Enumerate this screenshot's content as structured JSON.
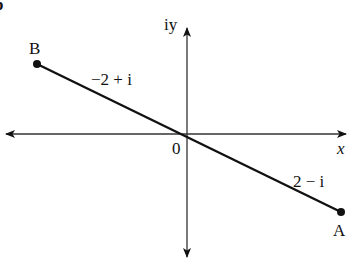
{
  "figure": {
    "part_label": "b",
    "axes": {
      "x_label": "x",
      "y_label": "iy",
      "origin_label": "0"
    },
    "points": [
      {
        "name": "B",
        "value": "−2 + i"
      },
      {
        "name": "A",
        "value": "2 − i"
      }
    ],
    "segment_labels": {
      "B": "−2 + i",
      "A": "2 − i"
    }
  }
}
